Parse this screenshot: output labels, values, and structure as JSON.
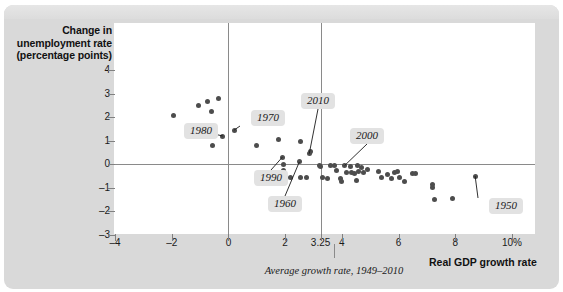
{
  "chart_data": {
    "type": "scatter",
    "title": "",
    "xlabel": "Real GDP growth rate",
    "ylabel": "Change in unemployment rate (percentage points)",
    "xlim": [
      -4,
      10
    ],
    "ylim": [
      -3,
      4.6
    ],
    "grid": false,
    "legend": null,
    "x_ticks": [
      {
        "value": -4,
        "label": "–4"
      },
      {
        "value": -2,
        "label": "–2"
      },
      {
        "value": 0,
        "label": "0"
      },
      {
        "value": 2,
        "label": "2"
      },
      {
        "value": 3.25,
        "label": "3.25"
      },
      {
        "value": 4,
        "label": "4"
      },
      {
        "value": 6,
        "label": "6"
      },
      {
        "value": 8,
        "label": "8"
      },
      {
        "value": 10,
        "label": "10%"
      }
    ],
    "y_ticks": [
      {
        "value": 4,
        "label": "4"
      },
      {
        "value": 3,
        "label": "3"
      },
      {
        "value": 2,
        "label": "2"
      },
      {
        "value": 1,
        "label": "1"
      },
      {
        "value": 0,
        "label": "0"
      },
      {
        "value": -1,
        "label": "–1"
      },
      {
        "value": -2,
        "label": "–2"
      },
      {
        "value": -3,
        "label": "–3"
      }
    ],
    "reference_lines": [
      {
        "orientation": "vertical",
        "value": 0,
        "label": ""
      },
      {
        "orientation": "vertical",
        "value": 3.25,
        "label": "Average growth rate, 1949–2010"
      },
      {
        "orientation": "horizontal",
        "value": 0,
        "label": ""
      }
    ],
    "annotations": [
      {
        "label": "1980",
        "point": [
          -0.2,
          1.2
        ]
      },
      {
        "label": "1970",
        "point": [
          0.2,
          1.45
        ]
      },
      {
        "label": "2010",
        "point": [
          2.85,
          0.45
        ]
      },
      {
        "label": "2000",
        "point": [
          4.1,
          -0.05
        ]
      },
      {
        "label": "1990",
        "point": [
          1.9,
          0.3
        ]
      },
      {
        "label": "1960",
        "point": [
          2.5,
          0.1
        ]
      },
      {
        "label": "1950",
        "point": [
          8.7,
          -0.5
        ]
      }
    ],
    "points": [
      [
        -1.95,
        2.05
      ],
      [
        -1.05,
        2.5
      ],
      [
        -0.75,
        2.65
      ],
      [
        -0.6,
        2.25
      ],
      [
        -0.35,
        2.8
      ],
      [
        -0.2,
        1.2
      ],
      [
        -0.55,
        0.8
      ],
      [
        0.2,
        1.45
      ],
      [
        1.0,
        0.8
      ],
      [
        1.75,
        1.05
      ],
      [
        1.9,
        0.3
      ],
      [
        1.95,
        0.0
      ],
      [
        1.95,
        -0.25
      ],
      [
        2.2,
        -0.55
      ],
      [
        2.5,
        0.1
      ],
      [
        2.55,
        -0.55
      ],
      [
        2.75,
        -0.55
      ],
      [
        2.85,
        0.45
      ],
      [
        2.55,
        0.95
      ],
      [
        2.9,
        0.55
      ],
      [
        3.2,
        -0.05
      ],
      [
        3.25,
        -0.1
      ],
      [
        3.3,
        -0.55
      ],
      [
        3.5,
        -0.6
      ],
      [
        3.6,
        -0.05
      ],
      [
        3.75,
        -0.05
      ],
      [
        3.8,
        -0.25
      ],
      [
        3.95,
        -0.6
      ],
      [
        4.0,
        -0.75
      ],
      [
        4.1,
        -0.05
      ],
      [
        4.15,
        -0.35
      ],
      [
        4.3,
        -0.1
      ],
      [
        4.35,
        -0.35
      ],
      [
        4.45,
        -0.4
      ],
      [
        4.5,
        -0.7
      ],
      [
        4.55,
        -0.05
      ],
      [
        4.6,
        -0.3
      ],
      [
        4.7,
        -0.15
      ],
      [
        4.75,
        -0.35
      ],
      [
        4.9,
        -0.2
      ],
      [
        5.3,
        -0.3
      ],
      [
        5.4,
        -0.55
      ],
      [
        5.6,
        -0.45
      ],
      [
        5.75,
        -0.6
      ],
      [
        5.85,
        -0.35
      ],
      [
        5.95,
        -0.3
      ],
      [
        6.05,
        -0.55
      ],
      [
        6.2,
        -0.75
      ],
      [
        6.5,
        -0.4
      ],
      [
        6.6,
        -0.4
      ],
      [
        7.2,
        -0.85
      ],
      [
        7.2,
        -1.0
      ],
      [
        7.25,
        -1.5
      ],
      [
        7.9,
        -1.45
      ],
      [
        8.7,
        -0.5
      ]
    ]
  },
  "figure": {
    "y_axis_title": "Change in unemployment rate (percentage points)",
    "x_axis_title": "Real GDP growth rate",
    "average_note": "Average growth rate, 1949–2010"
  },
  "colors": {
    "panel": "#d9d9d9",
    "plot_background": "#ffffff",
    "point": "#4d4d4d",
    "axis": "#8a8a8a",
    "chip": "#e2e2e2",
    "text": "#1a1a1a"
  }
}
